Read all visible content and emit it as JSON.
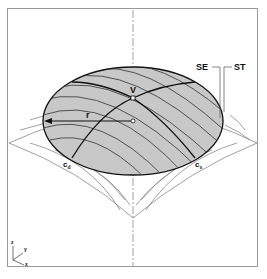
{
  "diagram": {
    "labels": {
      "vertex": "V",
      "radius": "r",
      "surface_edge": "SE",
      "surface_tangent": "ST",
      "curve_left_main": "c",
      "curve_left_sub": "d",
      "curve_right_main": "c",
      "curve_right_sub": "s"
    },
    "axes": {
      "z": "z",
      "y": "y",
      "x": "x"
    },
    "colors": {
      "cap_fill": "#c8c8c8",
      "outline": "#111111",
      "surface_lines": "#777777",
      "frame": "#999999"
    }
  }
}
